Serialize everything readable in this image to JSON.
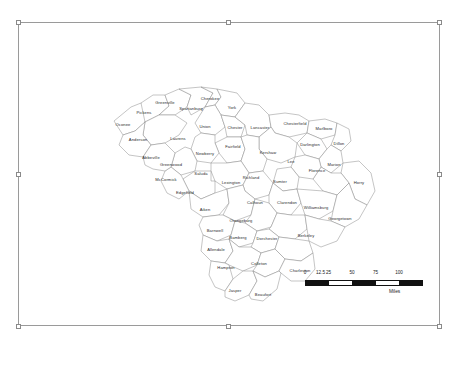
{
  "frame": {
    "title": "South Carolina Counties Map Frame",
    "handles": [
      "top-left",
      "top-center",
      "top-right",
      "middle-left",
      "middle-right",
      "bottom-left",
      "bottom-center",
      "bottom-right"
    ]
  },
  "map": {
    "name": "south-carolina-counties",
    "counties": [
      {
        "name": "Oconee",
        "x": 104,
        "y": 102
      },
      {
        "name": "Pickens",
        "x": 125,
        "y": 90
      },
      {
        "name": "Greenville",
        "x": 146,
        "y": 80
      },
      {
        "name": "Spartanburg",
        "x": 172,
        "y": 86
      },
      {
        "name": "Cherokee",
        "x": 191,
        "y": 76
      },
      {
        "name": "York",
        "x": 213,
        "y": 85
      },
      {
        "name": "Chester",
        "x": 216,
        "y": 105
      },
      {
        "name": "Lancaster",
        "x": 241,
        "y": 105
      },
      {
        "name": "Chesterfield",
        "x": 276,
        "y": 101
      },
      {
        "name": "Marlboro",
        "x": 305,
        "y": 106
      },
      {
        "name": "Dillon",
        "x": 320,
        "y": 121
      },
      {
        "name": "Darlington",
        "x": 291,
        "y": 122
      },
      {
        "name": "Anderson",
        "x": 119,
        "y": 117
      },
      {
        "name": "Laurens",
        "x": 159,
        "y": 116
      },
      {
        "name": "Union",
        "x": 186,
        "y": 104
      },
      {
        "name": "Fairfield",
        "x": 214,
        "y": 124
      },
      {
        "name": "Kershaw",
        "x": 249,
        "y": 130
      },
      {
        "name": "Lee",
        "x": 272,
        "y": 139
      },
      {
        "name": "Marion",
        "x": 315,
        "y": 142
      },
      {
        "name": "Florence",
        "x": 298,
        "y": 148
      },
      {
        "name": "Horry",
        "x": 340,
        "y": 160
      },
      {
        "name": "Abbeville",
        "x": 132,
        "y": 135
      },
      {
        "name": "Greenwood",
        "x": 152,
        "y": 142
      },
      {
        "name": "Newberry",
        "x": 186,
        "y": 131
      },
      {
        "name": "Saluda",
        "x": 182,
        "y": 151
      },
      {
        "name": "McCormick",
        "x": 147,
        "y": 157
      },
      {
        "name": "Edgefield",
        "x": 166,
        "y": 170
      },
      {
        "name": "Lexington",
        "x": 212,
        "y": 160
      },
      {
        "name": "Richland",
        "x": 232,
        "y": 155
      },
      {
        "name": "Sumter",
        "x": 261,
        "y": 159
      },
      {
        "name": "Clarendon",
        "x": 268,
        "y": 180
      },
      {
        "name": "Williamsburg",
        "x": 297,
        "y": 185
      },
      {
        "name": "Georgetown",
        "x": 321,
        "y": 196
      },
      {
        "name": "Aiken",
        "x": 186,
        "y": 187
      },
      {
        "name": "Calhoun",
        "x": 236,
        "y": 180
      },
      {
        "name": "Orangeburg",
        "x": 222,
        "y": 198
      },
      {
        "name": "Barnwell",
        "x": 196,
        "y": 208
      },
      {
        "name": "Bamberg",
        "x": 219,
        "y": 215
      },
      {
        "name": "Dorchester",
        "x": 248,
        "y": 216
      },
      {
        "name": "Berkeley",
        "x": 287,
        "y": 213
      },
      {
        "name": "Allendale",
        "x": 197,
        "y": 227
      },
      {
        "name": "Hampton",
        "x": 207,
        "y": 245
      },
      {
        "name": "Colleton",
        "x": 240,
        "y": 241
      },
      {
        "name": "Charleston",
        "x": 281,
        "y": 248
      },
      {
        "name": "Jasper",
        "x": 216,
        "y": 268
      },
      {
        "name": "Beaufort",
        "x": 244,
        "y": 272
      }
    ]
  },
  "scale_bar": {
    "ticks": [
      "0",
      "12.5",
      "25",
      "50",
      "75",
      "100"
    ],
    "unit_label": "Miles"
  }
}
